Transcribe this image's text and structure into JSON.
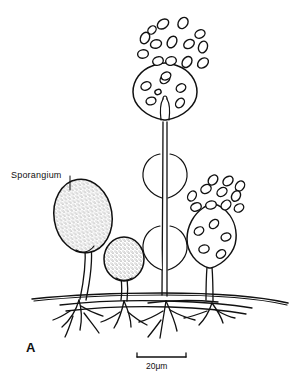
{
  "figure": {
    "panel_letter": "A",
    "background_color": "#ffffff",
    "ink_color": "#111111"
  },
  "annotations": {
    "sporangium_label": "Sporangium"
  },
  "scale": {
    "value": "20",
    "unit": "μm",
    "text": "20μm"
  },
  "structures": {
    "labeled_sporangium": {
      "name": "mature stippled sporangium",
      "texture": "stippled"
    },
    "small_sporangium": {
      "name": "immature sporangium"
    },
    "central_sporangiophore": {
      "name": "tall sporangiophore with dehisced sporangium and empty husks"
    },
    "right_sporangium": {
      "name": "dehiscing sporangium releasing spores"
    },
    "substrate": {
      "name": "substrate surface line with rhizoids and stolons"
    }
  },
  "spore_clouds": {
    "top_cloud_label": "released spores above central sporangium",
    "right_cloud_label": "released spores above right sporangium"
  }
}
